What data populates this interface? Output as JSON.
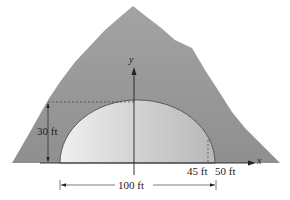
{
  "figure": {
    "axes": {
      "x_label": "x",
      "y_label": "y"
    },
    "labels": {
      "height": "30 ft",
      "inner_half_width": "45 ft",
      "outer_half_width": "50 ft",
      "total_width": "100 ft"
    },
    "colors": {
      "mountain": "#9a9a9a",
      "tunnel_light": "#f2f2f2",
      "tunnel_dark": "#bdbdbd",
      "ink": "#222222"
    }
  }
}
